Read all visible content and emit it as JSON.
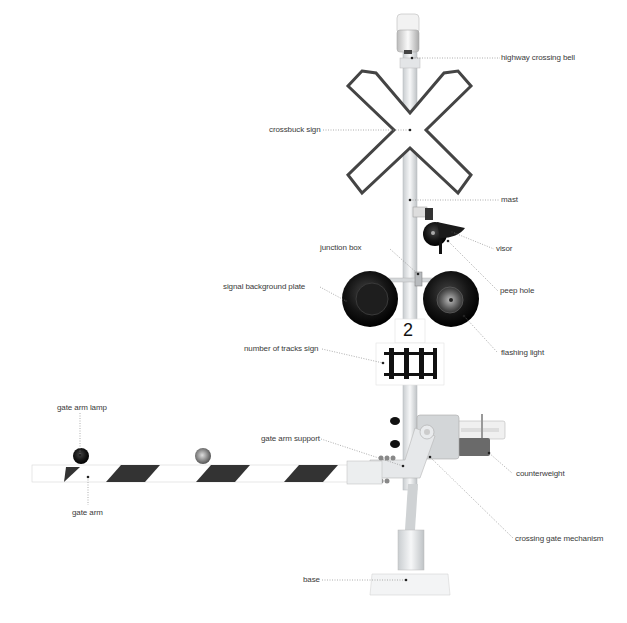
{
  "diagram": {
    "labels": {
      "bell": "highway crossing bell",
      "crossbuck": "crossbuck sign",
      "mast": "mast",
      "visor": "visor",
      "junction_box": "junction box",
      "peep_hole": "peep hole",
      "background_plate": "signal background plate",
      "flashing_light": "flashing light",
      "tracks_sign": "number of tracks sign",
      "gate_arm_lamp": "gate arm lamp",
      "gate_arm_support": "gate arm support",
      "counterweight": "counterweight",
      "gate_arm": "gate arm",
      "gate_mechanism": "crossing gate mechanism",
      "base": "base"
    },
    "tracks_number": "2",
    "colors": {
      "label_text": "#3a3a3a",
      "leader_line": "#8a8a8a",
      "signal_black": "#111111",
      "stripe": "#333333",
      "metal": "#d9dcde"
    }
  }
}
